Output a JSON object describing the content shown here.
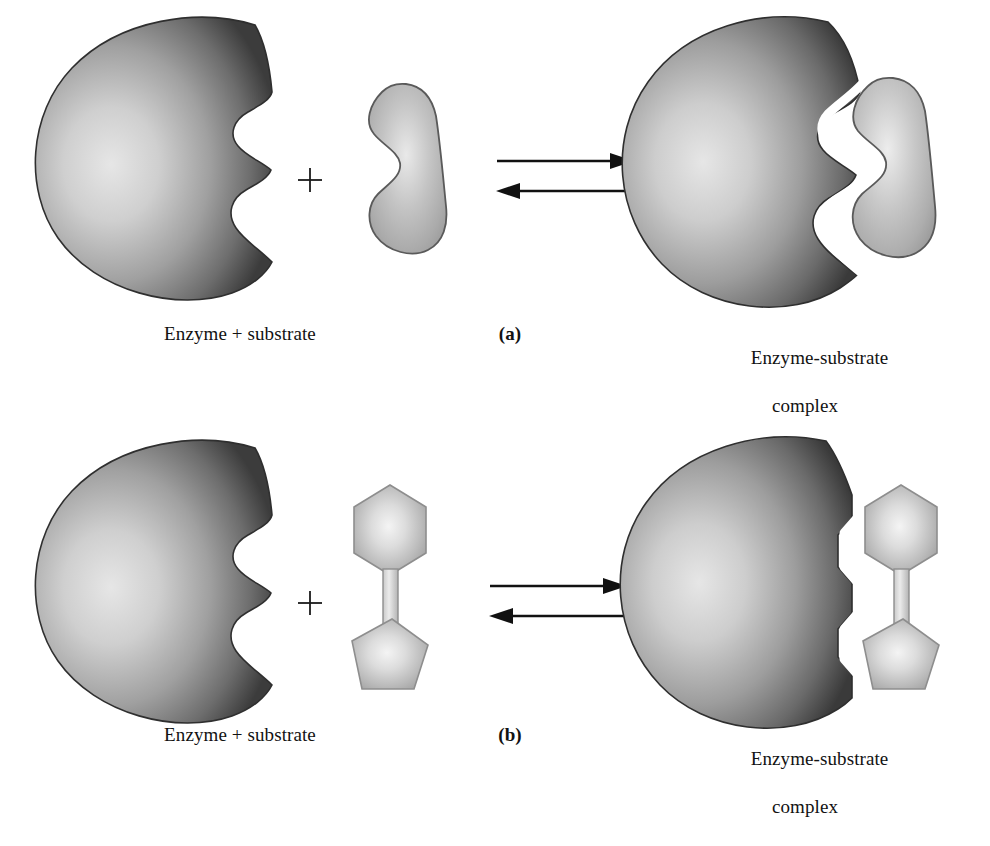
{
  "figure": {
    "background_color": "#ffffff"
  },
  "colors": {
    "enzyme_highlight": "#e2e2e2",
    "enzyme_mid": "#9a9a9a",
    "enzyme_rim": "#3f3f3f",
    "enzyme_outline": "#2e2e2e",
    "substrate_highlight": "#f2f2f2",
    "substrate_mid": "#b8b8b8",
    "substrate_rim": "#8a8a8a",
    "substrate_outline": "#4a4a4a",
    "complex_gap": "#ffffff",
    "arrow_color": "#111111",
    "text_color": "#121212"
  },
  "panels": [
    {
      "id": "a",
      "letter": "(a)",
      "model": "lock-and-key",
      "left_label": "Enzyme + substrate",
      "plus": "+",
      "right_label_line1": "Enzyme-substrate",
      "right_label_line2": "complex",
      "reactants": {
        "enzyme_name": "enzyme-sphere-notched",
        "substrate_name": "substrate-crescent"
      },
      "arrows": {
        "forward": "forward-arrow",
        "reverse": "reverse-arrow",
        "type": "equilibrium"
      },
      "product": {
        "complex_name": "enzyme-substrate-complex-crescent"
      }
    },
    {
      "id": "b",
      "letter": "(b)",
      "model": "induced-fit",
      "left_label": "Enzyme + substrate",
      "plus": "+",
      "right_label_line1": "Enzyme-substrate",
      "right_label_line2": "complex",
      "reactants": {
        "enzyme_name": "enzyme-sphere-notched",
        "substrate_name": "substrate-hexagon-pentagon"
      },
      "arrows": {
        "forward": "forward-arrow",
        "reverse": "reverse-arrow",
        "type": "equilibrium"
      },
      "product": {
        "complex_name": "enzyme-substrate-complex-hexagon-pentagon"
      }
    }
  ]
}
